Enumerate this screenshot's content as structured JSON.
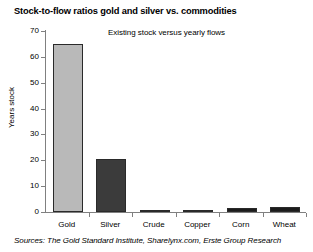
{
  "chart_data": {
    "type": "bar",
    "title": "Stock-to-flow ratios gold and silver vs. commodities",
    "subtitle": "Existing stock versus yearly flows",
    "xlabel": "",
    "ylabel": "Years stock",
    "categories": [
      "Gold",
      "Silver",
      "Crude",
      "Copper",
      "Corn",
      "Wheat"
    ],
    "values": [
      65,
      20.5,
      0.5,
      0.4,
      1.5,
      1.8
    ],
    "series": [
      {
        "name": "Years stock",
        "values": [
          65,
          20.5,
          0.5,
          0.4,
          1.5,
          1.8
        ]
      }
    ],
    "bar_colors": [
      "#b9b9b9",
      "#3b3b3b",
      "#1c1c1c",
      "#1c1c1c",
      "#1c1c1c",
      "#1c1c1c"
    ],
    "ylim": [
      0,
      70
    ],
    "yticks": [
      0,
      10,
      20,
      30,
      40,
      50,
      60,
      70
    ],
    "ytick_labels": [
      "0",
      "10",
      "20",
      "30",
      "40",
      "50",
      "60",
      "70"
    ],
    "grid": false,
    "legend": false,
    "legend_position": "none",
    "source": "Sources: The Gold Standard Institute, Sharelynx.com, Erste Group Research",
    "axis_color": "#808080"
  }
}
